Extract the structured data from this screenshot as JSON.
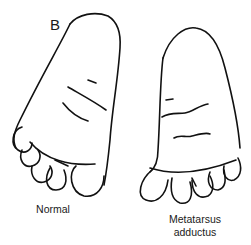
{
  "figure": {
    "panel_label": "B",
    "left_foot": {
      "caption": "Normal"
    },
    "right_foot": {
      "caption_line1": "Metatarsus",
      "caption_line2": "adductus"
    }
  }
}
